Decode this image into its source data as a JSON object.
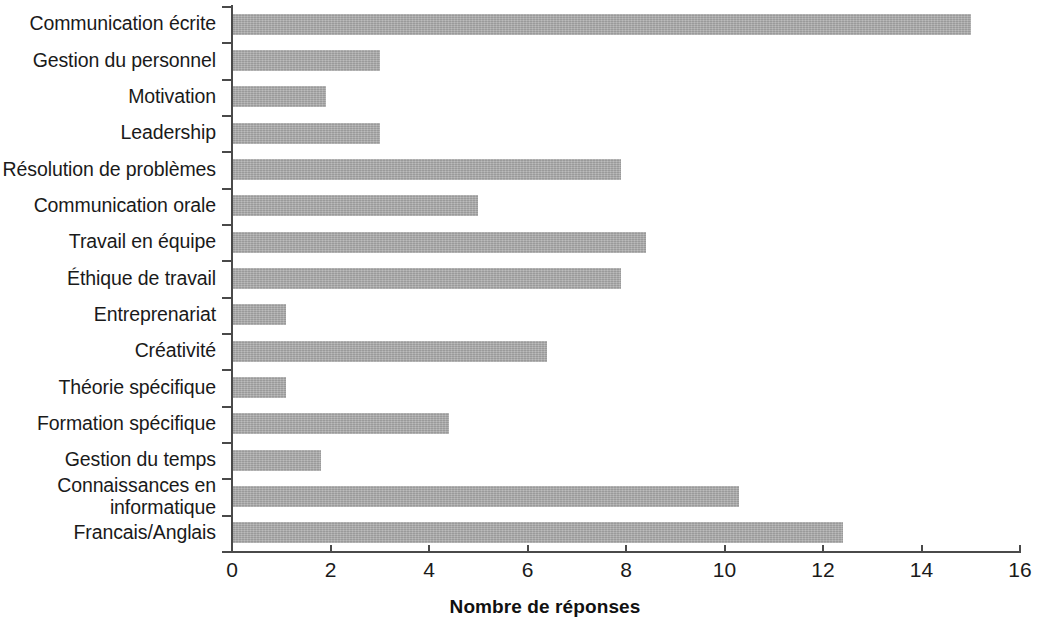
{
  "chart_data": {
    "type": "bar",
    "orientation": "horizontal",
    "title": "",
    "xlabel": "Nombre de réponses",
    "ylabel": "",
    "xlim": [
      0,
      16
    ],
    "xticks": [
      "0",
      "2",
      "4",
      "6",
      "8",
      "10",
      "12",
      "14",
      "16"
    ],
    "grid": false,
    "legend": null,
    "bar_color": "#a9a9a9",
    "axis_color": "#4a4a4a",
    "text_color": "#1a1a1a",
    "categories": [
      "Communication écrite",
      "Gestion du personnel",
      "Motivation",
      "Leadership",
      "Résolution de problèmes",
      "Communication orale",
      "Travail en équipe",
      "Éthique de travail",
      "Entreprenariat",
      "Créativité",
      "Théorie spécifique",
      "Formation spécifique",
      "Gestion du temps",
      "Connaissances en\ninformatique",
      "Francais/Anglais"
    ],
    "values": [
      15.0,
      3.0,
      1.9,
      3.0,
      7.9,
      5.0,
      8.4,
      7.9,
      1.1,
      6.4,
      1.1,
      4.4,
      1.8,
      10.3,
      12.4
    ]
  }
}
